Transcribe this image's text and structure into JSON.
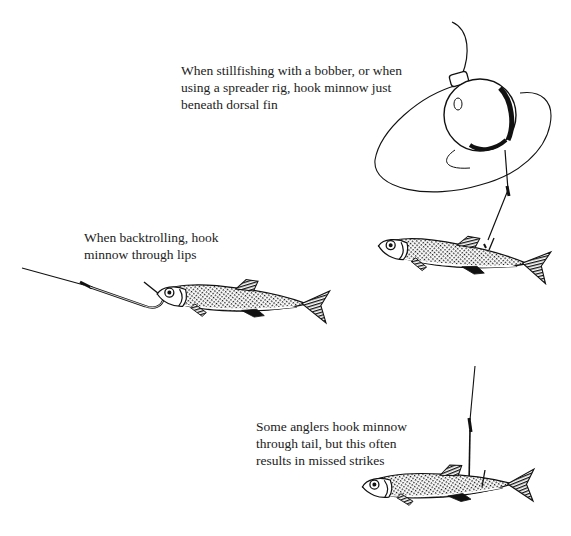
{
  "page": {
    "type": "instructional-illustration",
    "background": "#ffffff",
    "ink_color": "#111111"
  },
  "captions": [
    {
      "id": "dorsal-fin",
      "lines": [
        "When stillfishing with a bobber, or when",
        "using a spreader rig, hook minnow just",
        "beneath dorsal fin"
      ]
    },
    {
      "id": "lips",
      "lines": [
        "When backtrolling, hook",
        "minnow through lips"
      ]
    },
    {
      "id": "tail",
      "lines": [
        "Some anglers hook minnow",
        "through tail, but this often",
        "results in missed strikes"
      ]
    }
  ],
  "illustrations": [
    {
      "name": "bobber-rig-minnow",
      "depicts": "minnow hooked beneath dorsal fin, hanging below a round bobber"
    },
    {
      "name": "backtrolling-minnow",
      "depicts": "minnow hooked through lips on a line"
    },
    {
      "name": "tail-hooked-minnow",
      "depicts": "minnow hooked through tail hanging from vertical line"
    }
  ]
}
